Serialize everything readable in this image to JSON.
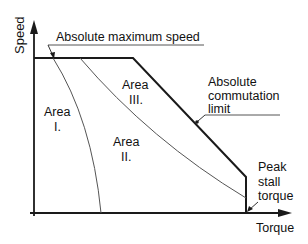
{
  "diagram": {
    "axes": {
      "y_label": "Speed",
      "x_label": "Torque"
    },
    "annotations": {
      "max_speed": "Absolute maximum speed",
      "commutation_line1": "Absolute",
      "commutation_line2": "commutation",
      "commutation_line3": "limit",
      "stall_line1": "Peak",
      "stall_line2": "stall",
      "stall_line3": "torque"
    },
    "areas": [
      {
        "line1": "Area",
        "line2": "I."
      },
      {
        "line1": "Area",
        "line2": "II."
      },
      {
        "line1": "Area",
        "line2": "III."
      }
    ],
    "colors": {
      "line": "#1a1a1a",
      "thin_line": "#555555",
      "background": "#ffffff"
    }
  }
}
